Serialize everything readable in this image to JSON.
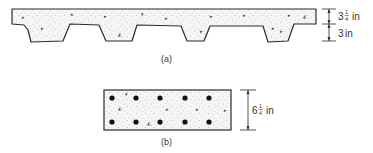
{
  "figure_a": {
    "caption": "(a)",
    "dimensions": [
      {
        "whole": "3",
        "frac_num": "1",
        "frac_den": "4",
        "unit": "in"
      },
      {
        "whole": "3",
        "frac_num": "",
        "frac_den": "",
        "unit": "in"
      }
    ],
    "description": "Ribbed concrete slab section with four trapezoidal ribs"
  },
  "figure_b": {
    "caption": "(b)",
    "dimension": {
      "whole": "6",
      "frac_num": "1",
      "frac_den": "4",
      "unit": "in"
    },
    "description": "Rectangular concrete slab section with two rows of reinforcing bars",
    "bars_per_row": 5,
    "rows": 2
  },
  "colors": {
    "line": "#2a2a2a",
    "concrete_fill": "#f4f4f4",
    "stipple": "#9a9a9a",
    "bar": "#111111"
  }
}
